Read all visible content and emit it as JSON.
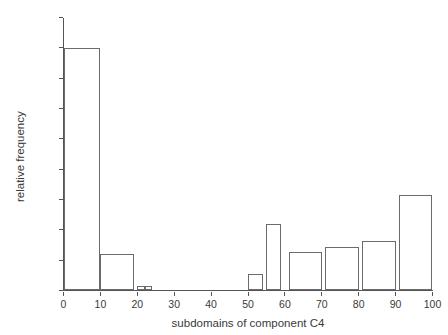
{
  "chart_data": {
    "type": "bar",
    "title": "",
    "subtitle": "",
    "xlabel": "subdomains of component C4",
    "ylabel": "relative frequency",
    "xlim": [
      0,
      100
    ],
    "ylim": [
      0,
      0.45
    ],
    "grid": false,
    "legend": null,
    "x_ticks": [
      0,
      10,
      20,
      30,
      40,
      50,
      60,
      70,
      80,
      90,
      100
    ],
    "x_tick_labels": [
      "0",
      "10",
      "20",
      "30",
      "40",
      "50",
      "60",
      "70",
      "80",
      "90",
      "100"
    ],
    "y_ticks": [
      0,
      0.05,
      0.1,
      0.15,
      0.2,
      0.25,
      0.3,
      0.35,
      0.4,
      0.45
    ],
    "y_tick_labels": [
      "0",
      "0.05",
      "0.1",
      "0.15",
      "0.2",
      "0.25",
      "0.3",
      "0.35",
      "0.4",
      "0.45"
    ],
    "bar_edge_color": "#6b6b6b",
    "bar_fill_color": "#ffffff",
    "bars": [
      {
        "x_start": 0,
        "x_end": 10,
        "value": 0.4
      },
      {
        "x_start": 10,
        "x_end": 19,
        "value": 0.06
      },
      {
        "x_start": 20,
        "x_end": 22,
        "value": 0.007
      },
      {
        "x_start": 22,
        "x_end": 24,
        "value": 0.008
      },
      {
        "x_start": 50,
        "x_end": 54,
        "value": 0.027
      },
      {
        "x_start": 55,
        "x_end": 59,
        "value": 0.11
      },
      {
        "x_start": 61,
        "x_end": 70,
        "value": 0.063
      },
      {
        "x_start": 71,
        "x_end": 80,
        "value": 0.072
      },
      {
        "x_start": 81,
        "x_end": 90,
        "value": 0.082
      },
      {
        "x_start": 91,
        "x_end": 100,
        "value": 0.157
      }
    ]
  }
}
